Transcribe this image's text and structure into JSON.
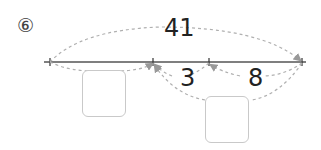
{
  "problem": {
    "number_label": "⑥"
  },
  "diagram": {
    "total_label": "41",
    "segment_a_label": "3",
    "segment_b_label": "8",
    "answer_box_1": "",
    "answer_box_2": ""
  },
  "colors": {
    "line": "#555555",
    "dashed_arc": "#b0b0b0",
    "box_border": "#c9c9c9",
    "text": "#222222"
  }
}
